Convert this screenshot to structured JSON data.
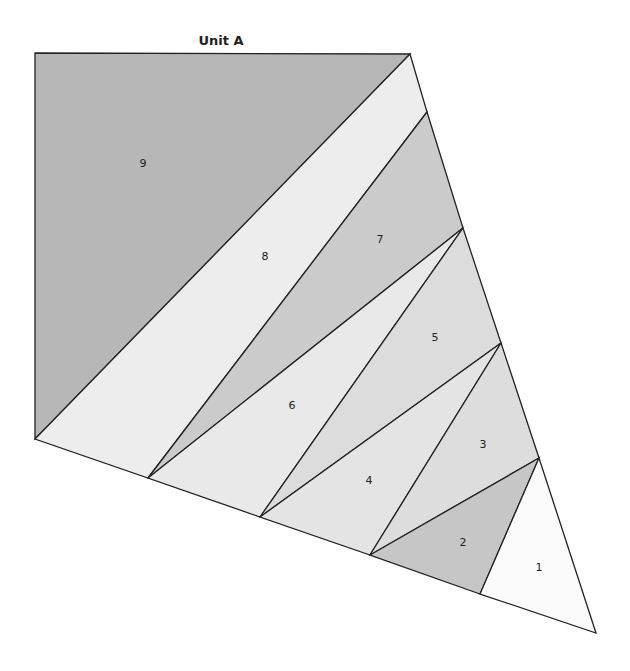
{
  "diagram": {
    "title": "Unit A",
    "pieces": [
      {
        "label": "1",
        "color": "#fbfbfb"
      },
      {
        "label": "2",
        "color": "#c6c6c6"
      },
      {
        "label": "3",
        "color": "#dddddd"
      },
      {
        "label": "4",
        "color": "#e4e4e4"
      },
      {
        "label": "5",
        "color": "#dcdcdc"
      },
      {
        "label": "6",
        "color": "#e9e9e9"
      },
      {
        "label": "7",
        "color": "#cbcbcb"
      },
      {
        "label": "8",
        "color": "#ededed"
      },
      {
        "label": "9",
        "color": "#b7b7b7"
      }
    ],
    "line_color": "#222222"
  }
}
